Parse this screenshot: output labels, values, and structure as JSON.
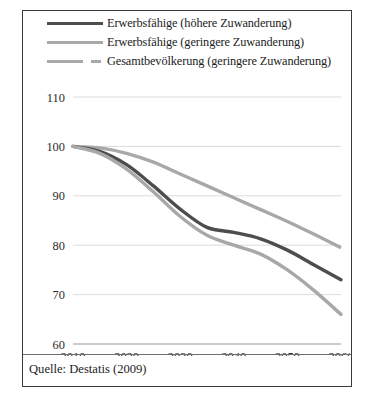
{
  "caption": {
    "text": "Quelle: Destatis (2009)"
  },
  "legend": {
    "position": "top-left",
    "items": [
      {
        "label": "Erwerbsfähige (höhere Zuwanderung)",
        "style": "solid",
        "color": "#4d4d4d",
        "swatch": "line-swatch-dark-solid"
      },
      {
        "label": "Erwerbsfähige (geringere Zuwanderung)",
        "style": "solid",
        "color": "#a8a8a8",
        "swatch": "line-swatch-light-solid"
      },
      {
        "label": "Gesamtbevölkerung (geringere Zuwanderung)",
        "style": "dashed",
        "color": "#a8a8a8",
        "swatch": "line-swatch-light-dashed"
      }
    ]
  },
  "chart_data": {
    "type": "line",
    "title": "",
    "xlabel": "",
    "ylabel": "",
    "x": [
      2010,
      2015,
      2020,
      2025,
      2030,
      2035,
      2040,
      2045,
      2050,
      2055,
      2060
    ],
    "xlim": [
      2010,
      2060
    ],
    "ylim": [
      60,
      110
    ],
    "xticks": [
      2010,
      2020,
      2030,
      2040,
      2050,
      2060
    ],
    "yticks": [
      60,
      70,
      80,
      90,
      100,
      110
    ],
    "grid": true,
    "series": [
      {
        "name": "Gesamtbevölkerung (geringere Zuwanderung)",
        "color": "#a8a8a8",
        "style": "dashed",
        "values": [
          100.0,
          99.7,
          98.6,
          96.8,
          94.4,
          92.0,
          89.6,
          87.2,
          84.8,
          82.2,
          79.5
        ]
      },
      {
        "name": "Erwerbsfähige (höhere Zuwanderung)",
        "color": "#4d4d4d",
        "style": "solid",
        "values": [
          100.0,
          99.0,
          96.3,
          92.0,
          87.3,
          83.6,
          82.6,
          81.3,
          79.0,
          76.0,
          73.0
        ]
      },
      {
        "name": "Erwerbsfähige (geringere Zuwanderung)",
        "color": "#a8a8a8",
        "style": "solid",
        "values": [
          100.0,
          98.6,
          95.4,
          90.8,
          85.8,
          82.0,
          80.0,
          78.2,
          75.0,
          70.8,
          66.0
        ]
      }
    ]
  }
}
